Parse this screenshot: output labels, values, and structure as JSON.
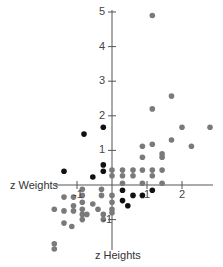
{
  "chart_data": {
    "type": "scatter",
    "title": "",
    "xlabel": "z Weights",
    "ylabel": "z Heights",
    "xlim": [
      -1.6,
      2.95
    ],
    "ylim": [
      -1.9,
      5.1
    ],
    "x_ticks": [
      -1,
      1,
      2
    ],
    "x_tick_labels": [
      "-1",
      "1",
      "2"
    ],
    "y_ticks": [
      -1,
      1,
      2,
      3,
      4,
      5
    ],
    "y_tick_labels": [
      "-1",
      "1",
      "2",
      "3",
      "4",
      "5"
    ],
    "grid": false,
    "legend": null,
    "series": [
      {
        "name": "gray",
        "color": "#7a7a7a",
        "points": [
          [
            1.15,
            4.9
          ],
          [
            1.7,
            2.57
          ],
          [
            1.15,
            2.2
          ],
          [
            2.0,
            1.67
          ],
          [
            2.8,
            1.67
          ],
          [
            1.7,
            1.3
          ],
          [
            2.27,
            1.12
          ],
          [
            1.15,
            1.18
          ],
          [
            0.87,
            1.12
          ],
          [
            1.43,
            0.9
          ],
          [
            1.43,
            0.8
          ],
          [
            0.87,
            0.8
          ],
          [
            0.0,
            0.43
          ],
          [
            0.3,
            0.43
          ],
          [
            0.6,
            0.43
          ],
          [
            0.87,
            0.43
          ],
          [
            1.15,
            0.43
          ],
          [
            1.43,
            0.43
          ],
          [
            0.0,
            0.27
          ],
          [
            0.3,
            0.27
          ],
          [
            0.6,
            0.27
          ],
          [
            1.15,
            0.27
          ],
          [
            0.3,
            0.05
          ],
          [
            0.87,
            0.05
          ],
          [
            1.43,
            0.05
          ],
          [
            -0.85,
            -0.12
          ],
          [
            -0.3,
            -0.12
          ],
          [
            0.0,
            -0.3
          ],
          [
            -0.3,
            -0.3
          ],
          [
            -1.37,
            -0.35
          ],
          [
            -1.1,
            -0.35
          ],
          [
            -0.85,
            -0.3
          ],
          [
            -1.1,
            -0.6
          ],
          [
            -0.85,
            -0.5
          ],
          [
            -0.55,
            -0.55
          ],
          [
            -0.85,
            -0.7
          ],
          [
            -1.1,
            -0.75
          ],
          [
            -1.37,
            -0.75
          ],
          [
            -1.65,
            -0.7
          ],
          [
            -0.4,
            -0.7
          ],
          [
            -0.25,
            -0.85
          ],
          [
            -0.85,
            -0.85
          ],
          [
            -0.72,
            -0.85
          ],
          [
            0.0,
            -0.5
          ],
          [
            0.0,
            -0.7
          ],
          [
            0.0,
            -0.8
          ],
          [
            -0.85,
            -1.0
          ],
          [
            -1.37,
            -1.1
          ],
          [
            -1.15,
            -1.2
          ],
          [
            -0.25,
            -1.0
          ],
          [
            -1.65,
            -1.7
          ],
          [
            -1.65,
            -1.85
          ]
        ]
      },
      {
        "name": "black",
        "color": "#111111",
        "points": [
          [
            -0.25,
            1.67
          ],
          [
            -0.8,
            1.47
          ],
          [
            -1.37,
            0.4
          ],
          [
            -0.55,
            0.23
          ],
          [
            -0.25,
            0.58
          ],
          [
            -0.25,
            0.4
          ],
          [
            0.3,
            -0.15
          ],
          [
            0.3,
            -0.45
          ],
          [
            0.45,
            -0.6
          ],
          [
            0.6,
            -0.3
          ],
          [
            0.87,
            -0.3
          ],
          [
            1.15,
            -0.15
          ]
        ]
      }
    ]
  }
}
